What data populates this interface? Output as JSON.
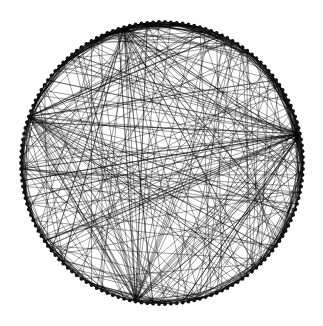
{
  "diagram": {
    "type": "circular-network-graph",
    "background": "#ffffff",
    "edge_color": "#000000",
    "node_color": "#111111",
    "center": [
      162,
      163
    ],
    "radius": 141,
    "node_count": 150,
    "node_radius": 1.9,
    "edge_opacity": 0.55,
    "edge_width": 0.7,
    "seed": 7,
    "structure": {
      "ring_edges_span_max": 14,
      "ring_edge_count": 420,
      "hubs": [
        {
          "angle_deg": -12,
          "degree": 40,
          "note": "right-side fan (wedge at ~x295,y125)"
        },
        {
          "angle_deg": 200,
          "degree": 34,
          "note": "left fan of near-horizontal chords"
        },
        {
          "angle_deg": 100,
          "degree": 30,
          "note": "bottom fan"
        },
        {
          "angle_deg": 255,
          "degree": 26,
          "note": "upper-left fan"
        }
      ],
      "random_chords": 160
    }
  }
}
